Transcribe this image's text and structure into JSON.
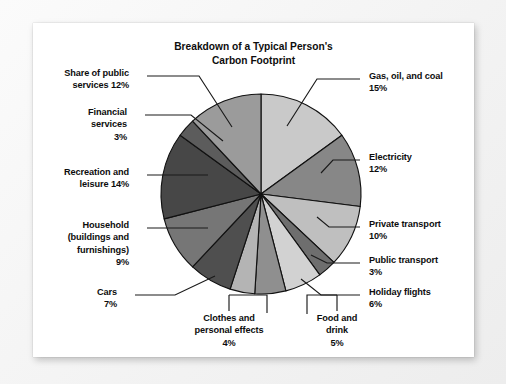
{
  "card": {
    "background": "#ffffff",
    "page_background": "#f3f3f3"
  },
  "chart_data": {
    "type": "pie",
    "title": "Breakdown of a Typical Person's\nCarbon Footprint",
    "xlabel": "",
    "ylabel": "",
    "units": "percent",
    "total": 100,
    "start_angle_deg": 0,
    "direction": "clockwise",
    "legend": "none (direct labels with leader lines)",
    "grid": false,
    "categories": [
      "Gas, oil, and coal",
      "Electricity",
      "Private transport",
      "Public transport",
      "Holiday flights",
      "Food and drink",
      "Clothes and personal effects",
      "Cars",
      "Household (buildings and furnishings)",
      "Recreation and leisure",
      "Financial services",
      "Share of public services"
    ],
    "values": [
      15,
      12,
      10,
      3,
      6,
      5,
      4,
      7,
      9,
      14,
      3,
      12
    ],
    "colors": [
      "#c9c9c9",
      "#878787",
      "#bfbfbf",
      "#6e6e6e",
      "#d2d2d2",
      "#8f8f8f",
      "#b4b4b4",
      "#4f4f4f",
      "#767676",
      "#474747",
      "#5c5c5c",
      "#9b9b9b"
    ]
  },
  "labels": [
    {
      "id": "share-of-public-services",
      "text": "Share of public\nservices 12%"
    },
    {
      "id": "financial-services",
      "text": "Financial\nservices\n3%"
    },
    {
      "id": "recreation-and-leisure",
      "text": "Recreation and\nleisure 14%"
    },
    {
      "id": "household",
      "text": "Household\n(buildings and\nfurnishings)\n9%"
    },
    {
      "id": "cars",
      "text": "Cars\n7%"
    },
    {
      "id": "clothes",
      "text": "Clothes and\npersonal effects\n4%"
    },
    {
      "id": "food-and-drink",
      "text": "Food and\ndrink\n5%"
    },
    {
      "id": "gas-oil-and-coal",
      "text": "Gas, oil, and coal\n15%"
    },
    {
      "id": "electricity",
      "text": "Electricity\n12%"
    },
    {
      "id": "private-transport",
      "text": "Private transport\n10%"
    },
    {
      "id": "public-transport",
      "text": "Public transport\n3%"
    },
    {
      "id": "holiday-flights",
      "text": "Holiday flights\n6%"
    }
  ]
}
